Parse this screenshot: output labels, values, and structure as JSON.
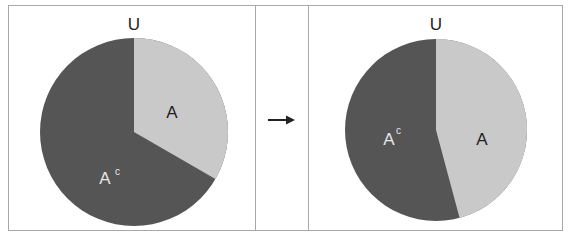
{
  "left_panel": {
    "universe_label": "U",
    "set_label": "A",
    "complement_label": "A",
    "complement_superscript": "c"
  },
  "arrow": {
    "icon": "right-arrow-icon"
  },
  "right_panel": {
    "universe_label": "U",
    "set_label": "A",
    "complement_label": "A",
    "complement_superscript": "c"
  },
  "colors": {
    "set_fill": "#c9c9c9",
    "complement_fill": "#555555",
    "border": "#a8a8a8",
    "background": "#ffffff"
  },
  "proportions": {
    "left_A_fraction": 0.333,
    "right_A_fraction": 0.46
  }
}
